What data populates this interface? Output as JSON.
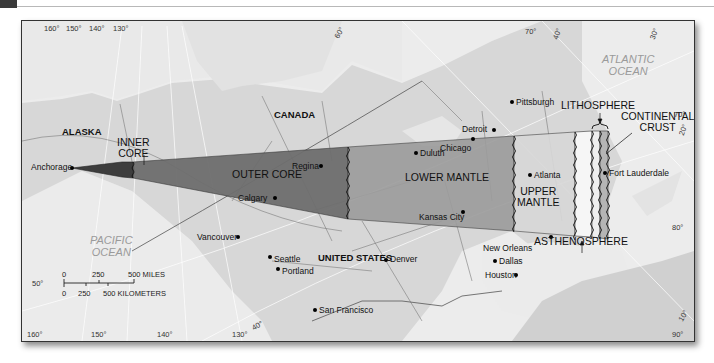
{
  "header": {
    "tab_color": "#3a3a3a"
  },
  "map": {
    "countries": [
      {
        "name": "CANADA"
      },
      {
        "name": "UNITED STATES"
      },
      {
        "name": "ALASKA"
      }
    ],
    "oceans": {
      "atlantic": {
        "line1": "ATLANTIC",
        "line2": "OCEAN"
      },
      "pacific": {
        "line1": "PACIFIC",
        "line2": "OCEAN"
      }
    },
    "cities": [
      {
        "name": "Anchorage"
      },
      {
        "name": "Regina"
      },
      {
        "name": "Calgary"
      },
      {
        "name": "Vancouver"
      },
      {
        "name": "Seattle"
      },
      {
        "name": "Portland"
      },
      {
        "name": "San Francisco"
      },
      {
        "name": "Denver"
      },
      {
        "name": "Duluth"
      },
      {
        "name": "Chicago"
      },
      {
        "name": "Detroit"
      },
      {
        "name": "Pittsburgh"
      },
      {
        "name": "Kansas City"
      },
      {
        "name": "Atlanta"
      },
      {
        "name": "New Orleans"
      },
      {
        "name": "Dallas"
      },
      {
        "name": "Houston"
      },
      {
        "name": "Fort Lauderdale"
      }
    ],
    "layers": {
      "inner_core": {
        "line1": "INNER",
        "line2": "CORE",
        "color": "#3d3d3d"
      },
      "outer_core": {
        "label": "OUTER CORE",
        "color": "#6e6e6e"
      },
      "lower_mantle": {
        "label": "LOWER MANTLE",
        "color": "#9c9c9c"
      },
      "upper_mantle": {
        "line1": "UPPER",
        "line2": "MANTLE",
        "color": "#d8d8d8"
      },
      "asthenosphere": {
        "label": "ASTHENOSPHERE",
        "color": "#f4f4f4"
      },
      "lithosphere": {
        "label": "LITHOSPHERE"
      },
      "continental_crust": {
        "line1": "CONTINENTAL",
        "line2": "CRUST",
        "color": "#b5b5b5"
      }
    },
    "graticule": {
      "top": [
        "160°",
        "150°",
        "140°",
        "130°"
      ],
      "bottom": [
        "160°",
        "150°",
        "140°",
        "130°"
      ],
      "diag": [
        "60°",
        "40°",
        "30°",
        "70°",
        "40°",
        "20°",
        "10°"
      ],
      "left": [
        "50°"
      ],
      "right": [
        "70°",
        "80°",
        "90°"
      ]
    },
    "scale_bar": {
      "miles": {
        "ticks": [
          "0",
          "250",
          "500 MILES"
        ]
      },
      "km": {
        "ticks": [
          "0",
          "250",
          "500 KILOMETERS"
        ]
      }
    }
  }
}
